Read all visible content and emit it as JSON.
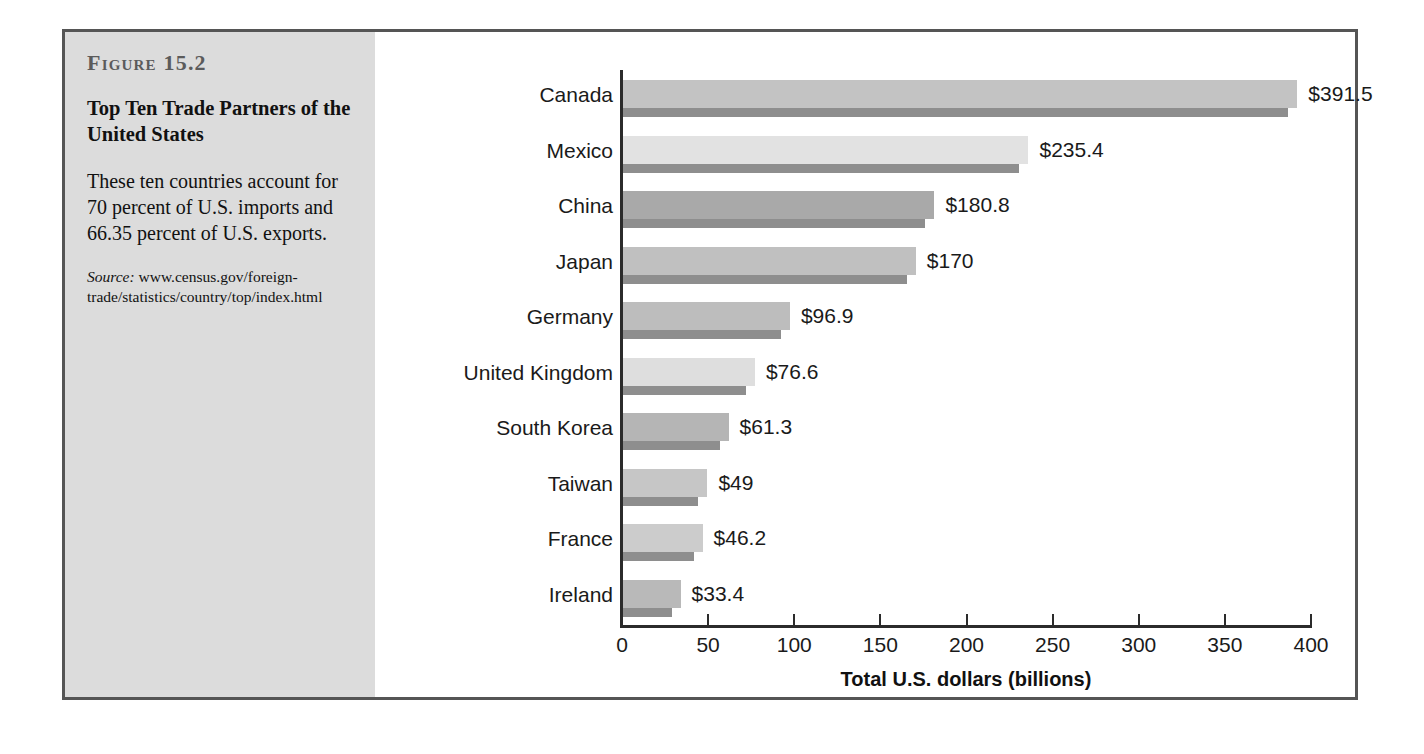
{
  "figure": {
    "number": "Figure 15.2",
    "title": "Top Ten Trade Partners of the United States",
    "description": "These ten countries account for 70 percent of U.S. imports and 66.35 percent of U.S. exports.",
    "source_label": "Source:",
    "source_text": " www.census.gov/foreign-trade/statistics/country/top/index.html"
  },
  "colors": {
    "frame_border": "#555555",
    "caption_background": "#dcdcdc",
    "chart_background": "#ffffff",
    "axis": "#2b2b2b",
    "bar_shadow": "#8e8e8e",
    "text": "#1a1a1a",
    "figure_number_text": "#5b5b5b"
  },
  "chart_data": {
    "type": "bar",
    "orientation": "horizontal",
    "title": "Top Ten Trade Partners of the United States",
    "xlabel": "Total U.S. dollars (billions)",
    "ylabel": "",
    "xlim": [
      0,
      400
    ],
    "xticks": [
      0,
      50,
      100,
      150,
      200,
      250,
      300,
      350,
      400
    ],
    "xtick_labels": [
      "0",
      "50",
      "100",
      "150",
      "200",
      "250",
      "300",
      "350",
      "400"
    ],
    "grid": false,
    "legend": null,
    "categories": [
      "Canada",
      "Mexico",
      "China",
      "Japan",
      "Germany",
      "United Kingdom",
      "South Korea",
      "Taiwan",
      "France",
      "Ireland"
    ],
    "values": [
      391.5,
      235.4,
      180.8,
      170,
      96.9,
      76.6,
      61.3,
      49,
      46.2,
      33.4
    ],
    "value_labels": [
      "$391.5",
      "$235.4",
      "$180.8",
      "$170",
      "$96.9",
      "$76.6",
      "$61.3",
      "$49",
      "$46.2",
      "$33.4"
    ],
    "bar_colors": [
      "#c3c3c3",
      "#e2e2e2",
      "#a9a9a9",
      "#c0c0c0",
      "#bdbdbd",
      "#dedede",
      "#b5b5b5",
      "#c6c6c6",
      "#cccccc",
      "#b9b9b9"
    ]
  }
}
